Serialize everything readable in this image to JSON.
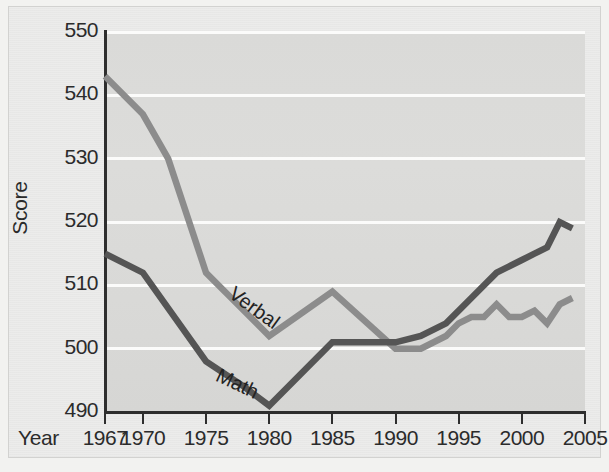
{
  "chart_data": {
    "type": "line",
    "title": "",
    "xlabel": "Year",
    "ylabel": "Score",
    "xlim": [
      1967,
      2005
    ],
    "ylim": [
      490,
      550
    ],
    "grid": true,
    "legend_position": "inline-annotation",
    "x_tick_labels": [
      "1967",
      "1970",
      "1975",
      "1980",
      "1985",
      "1990",
      "1995",
      "2000",
      "2005"
    ],
    "x_tick_values": [
      1967,
      1970,
      1975,
      1980,
      1985,
      1990,
      1995,
      2000,
      2005
    ],
    "y_tick_labels": [
      "550",
      "540",
      "530",
      "520",
      "510",
      "500",
      "490"
    ],
    "y_tick_values": [
      550,
      540,
      530,
      520,
      510,
      500,
      490
    ],
    "series": [
      {
        "name": "Verbal",
        "color": "#8c8c8c",
        "x": [
          1967,
          1970,
          1972,
          1975,
          1980,
          1985,
          1990,
          1992,
          1994,
          1995,
          1996,
          1997,
          1998,
          1999,
          2000,
          2001,
          2002,
          2003,
          2004
        ],
        "values": [
          543,
          537,
          530,
          512,
          502,
          509,
          500,
          500,
          502,
          504,
          505,
          505,
          507,
          505,
          505,
          506,
          504,
          507,
          508
        ]
      },
      {
        "name": "Math",
        "color": "#555555",
        "x": [
          1967,
          1970,
          1975,
          1978,
          1980,
          1985,
          1990,
          1992,
          1994,
          1996,
          1998,
          1999,
          2000,
          2001,
          2002,
          2003,
          2004
        ],
        "values": [
          515,
          512,
          498,
          494,
          491,
          501,
          501,
          502,
          504,
          508,
          512,
          513,
          514,
          515,
          516,
          520,
          519
        ]
      }
    ],
    "annotations": [
      {
        "text": "Verbal",
        "series": "Verbal",
        "near_x": 1981,
        "rotation_deg": 36
      },
      {
        "text": "Math",
        "series": "Math",
        "near_x": 1979,
        "rotation_deg": 25
      }
    ]
  },
  "axes": {
    "y_title": "Score",
    "x_title": "Year"
  },
  "colors": {
    "verbal": "#8c8c8c",
    "math": "#555555",
    "plot_background": "#dadad8",
    "gridline": "#fbfbfa",
    "axis": "#2e2e2e",
    "page_background": "#ececeb"
  }
}
